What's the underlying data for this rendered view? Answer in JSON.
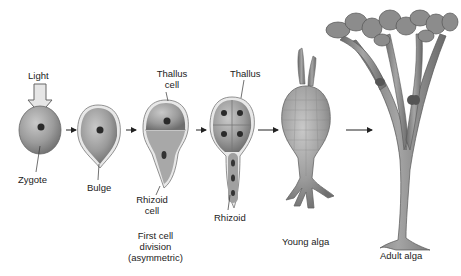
{
  "diagram": {
    "stages": [
      {
        "id": "zygote",
        "label": "Zygote"
      },
      {
        "id": "bulge",
        "label": "Bulge"
      },
      {
        "id": "first-division",
        "labels": [
          "Thallus cell",
          "Rhizoid cell"
        ],
        "caption": [
          "First cell",
          "division",
          "(asymmetric)"
        ]
      },
      {
        "id": "four-cell",
        "labels": [
          "Thallus",
          "Rhizoid"
        ]
      },
      {
        "id": "young-alga",
        "caption": "Young alga"
      },
      {
        "id": "adult-alga",
        "caption": "Adult alga"
      }
    ],
    "light_label": "Light",
    "colors": {
      "cell_fill": "#9a9a9a",
      "cell_edge": "#6f6f6f",
      "nucleus": "#2a2a2a",
      "wall": "#d8d8d8",
      "arrow": "#222222"
    }
  }
}
